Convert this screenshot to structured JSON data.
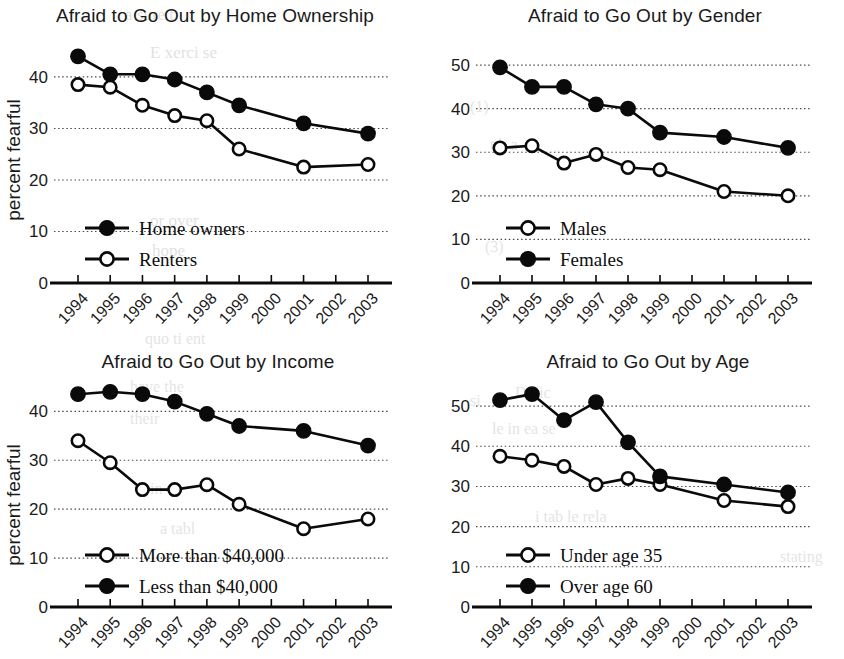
{
  "figure": {
    "y_axis_label": "percent fearful",
    "years": [
      "1994",
      "1995",
      "1996",
      "1997",
      "1998",
      "1999",
      "2000",
      "2001",
      "2002",
      "2003"
    ]
  },
  "chart_data": [
    {
      "id": "home-ownership",
      "type": "line",
      "title": "Afraid to Go Out by Home Ownership",
      "xlabel": "",
      "ylabel": "percent fearful",
      "ylim": [
        0,
        46
      ],
      "yticks": [
        0,
        10,
        20,
        30,
        40
      ],
      "grid": true,
      "legend_position": "inside-bottom-left",
      "categories": [
        "1994",
        "1995",
        "1996",
        "1997",
        "1998",
        "1999",
        "2000",
        "2001",
        "2002",
        "2003"
      ],
      "x": [
        1994,
        1995,
        1996,
        1997,
        1998,
        1999,
        2001,
        2003
      ],
      "series": [
        {
          "name": "Home owners",
          "marker": "filled-circle",
          "values": [
            44,
            40.5,
            40.5,
            39.5,
            37,
            34.5,
            31,
            29
          ]
        },
        {
          "name": "Renters",
          "marker": "open-circle",
          "values": [
            38.5,
            38,
            34.5,
            32.5,
            31.5,
            26,
            22.5,
            23
          ]
        }
      ]
    },
    {
      "id": "gender",
      "type": "line",
      "title": "Afraid to  Go Out by Gender",
      "xlabel": "",
      "ylabel": "",
      "ylim": [
        0,
        53
      ],
      "yticks": [
        0,
        10,
        20,
        30,
        40,
        50
      ],
      "grid": true,
      "legend_position": "inside-bottom-left",
      "categories": [
        "1994",
        "1995",
        "1996",
        "1997",
        "1998",
        "1999",
        "2000",
        "2001",
        "2002",
        "2003"
      ],
      "x": [
        1994,
        1995,
        1996,
        1997,
        1998,
        1999,
        2001,
        2003
      ],
      "series": [
        {
          "name": "Males",
          "marker": "open-circle",
          "values": [
            31,
            31.5,
            27.5,
            29.5,
            26.5,
            26,
            21,
            20
          ]
        },
        {
          "name": "Females",
          "marker": "filled-circle",
          "values": [
            49.5,
            45,
            45,
            41,
            40,
            34.5,
            33.5,
            31
          ]
        }
      ]
    },
    {
      "id": "income",
      "type": "line",
      "title": "Afraid to Go Out by Income",
      "xlabel": "",
      "ylabel": "percent fearful",
      "ylim": [
        0,
        46
      ],
      "yticks": [
        0,
        10,
        20,
        30,
        40
      ],
      "grid": true,
      "legend_position": "inside-bottom-left",
      "categories": [
        "1994",
        "1995",
        "1996",
        "1997",
        "1998",
        "1999",
        "2000",
        "2001",
        "2002",
        "2003"
      ],
      "x": [
        1994,
        1995,
        1996,
        1997,
        1998,
        1999,
        2001,
        2003
      ],
      "series": [
        {
          "name": "More than $40,000",
          "marker": "open-circle",
          "values": [
            34,
            29.5,
            24,
            24,
            25,
            21,
            16,
            18
          ]
        },
        {
          "name": "Less than $40,000",
          "marker": "filled-circle",
          "values": [
            43.5,
            44,
            43.5,
            42,
            39.5,
            37,
            36,
            33
          ]
        }
      ]
    },
    {
      "id": "age",
      "type": "line",
      "title": "Afraid to Go Out by Age",
      "xlabel": "",
      "ylabel": "",
      "ylim": [
        0,
        56
      ],
      "yticks": [
        0,
        10,
        20,
        30,
        40,
        50
      ],
      "grid": true,
      "legend_position": "inside-bottom-left",
      "categories": [
        "1994",
        "1995",
        "1996",
        "1997",
        "1998",
        "1999",
        "2000",
        "2001",
        "2002",
        "2003"
      ],
      "x": [
        1994,
        1995,
        1996,
        1997,
        1998,
        1999,
        2001,
        2003
      ],
      "series": [
        {
          "name": "Under age 35",
          "marker": "open-circle",
          "values": [
            37.5,
            36.5,
            35,
            30.5,
            32,
            30.5,
            26.5,
            25
          ]
        },
        {
          "name": "Over age 60",
          "marker": "filled-circle",
          "values": [
            51.5,
            53,
            46.5,
            51,
            41,
            32.5,
            30.5,
            28.5
          ]
        }
      ]
    }
  ],
  "bleed_text": [
    {
      "t": "a suret",
      "x": 120,
      "y": 22
    },
    {
      "t": "E xerci se",
      "x": 140,
      "y": 60
    },
    {
      "t": "or over",
      "x": 150,
      "y": 225
    },
    {
      "t": "hope",
      "x": 150,
      "y": 258
    },
    {
      "t": "quo ti ent",
      "x": 150,
      "y": 342
    },
    {
      "t": "have the",
      "x": 130,
      "y": 390
    },
    {
      "t": "their",
      "x": 135,
      "y": 420
    },
    {
      "t": "in",
      "x": 150,
      "y": 490
    },
    {
      "t": "a tabl",
      "x": 160,
      "y": 530
    },
    {
      "t": "si",
      "x": 470,
      "y": 410
    },
    {
      "t": "Defic",
      "x": 520,
      "y": 398
    },
    {
      "t": "le in ea se",
      "x": 500,
      "y": 430
    },
    {
      "t": "i tab le rela",
      "x": 540,
      "y": 520
    },
    {
      "t": "stating",
      "x": 790,
      "y": 560
    }
  ]
}
